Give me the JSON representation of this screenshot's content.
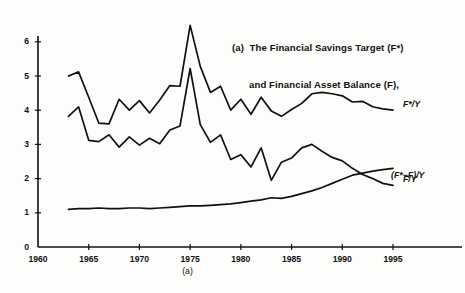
{
  "chart_data": {
    "type": "line",
    "title": "(a)  The Financial Savings Target (F*)\n      and Financial Asset Balance (F),",
    "title_line1": "(a)  The Financial Savings Target (F*)",
    "title_line2": "and Financial Asset Balance (F),",
    "panel_caption": "(a)",
    "xlabel": "",
    "ylabel": "",
    "xlim": [
      1960,
      1997
    ],
    "ylim": [
      0,
      6.6
    ],
    "grid": false,
    "legend_position": "right-inline",
    "xticks": [
      1960,
      1965,
      1970,
      1975,
      1980,
      1985,
      1990,
      1995
    ],
    "yticks": [
      0,
      1,
      2,
      3,
      4,
      5,
      6
    ],
    "x": [
      1963,
      1964,
      1965,
      1966,
      1967,
      1968,
      1969,
      1970,
      1971,
      1972,
      1973,
      1974,
      1975,
      1976,
      1977,
      1978,
      1979,
      1980,
      1981,
      1982,
      1983,
      1984,
      1985,
      1986,
      1987,
      1988,
      1989,
      1990,
      1991,
      1992,
      1993,
      1994,
      1995
    ],
    "series": [
      {
        "name": "F*/Y",
        "label": "F*/Y",
        "values": [
          5.0,
          5.12,
          4.38,
          3.62,
          3.6,
          4.32,
          4.0,
          4.28,
          3.92,
          4.3,
          4.72,
          4.7,
          6.48,
          5.28,
          4.52,
          4.7,
          4.0,
          4.32,
          3.88,
          4.38,
          3.98,
          3.82,
          4.02,
          4.2,
          4.48,
          4.52,
          4.48,
          4.42,
          4.24,
          4.26,
          4.1,
          4.04,
          4.0
        ]
      },
      {
        "name": "F/Y",
        "label": "F/Y",
        "values": [
          3.82,
          4.1,
          3.12,
          3.08,
          3.28,
          2.92,
          3.22,
          2.98,
          3.18,
          3.02,
          3.42,
          3.54,
          5.22,
          3.58,
          3.06,
          3.28,
          2.56,
          2.7,
          2.34,
          2.9,
          1.95,
          2.48,
          2.6,
          2.9,
          3.0,
          2.8,
          2.62,
          2.52,
          2.3,
          2.12,
          2.0,
          1.86,
          1.8
        ]
      },
      {
        "name": "(F*-F)/Y",
        "label": "(F*−F)/Y",
        "values": [
          1.1,
          1.12,
          1.12,
          1.14,
          1.12,
          1.12,
          1.14,
          1.14,
          1.12,
          1.14,
          1.16,
          1.18,
          1.2,
          1.2,
          1.22,
          1.24,
          1.26,
          1.3,
          1.34,
          1.38,
          1.44,
          1.42,
          1.48,
          1.56,
          1.64,
          1.74,
          1.86,
          1.98,
          2.1,
          2.16,
          2.22,
          2.26,
          2.3
        ]
      }
    ],
    "series_labels": [
      "F*/Y",
      "F/Y",
      "(F*−F)/Y"
    ],
    "line_color": "#111111"
  }
}
